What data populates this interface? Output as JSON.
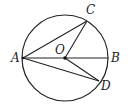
{
  "diagram": {
    "type": "circle-geometry",
    "circle": {
      "center": "O",
      "cx": 65,
      "cy": 58,
      "r": 43
    },
    "points": [
      {
        "id": "A",
        "x": 23,
        "y": 58,
        "label": "A",
        "lx": 11,
        "ly": 62
      },
      {
        "id": "B",
        "x": 108,
        "y": 58,
        "label": "B",
        "lx": 111,
        "ly": 62
      },
      {
        "id": "C",
        "x": 87,
        "y": 21,
        "label": "C",
        "lx": 86,
        "ly": 14
      },
      {
        "id": "D",
        "x": 99,
        "y": 81,
        "label": "D",
        "lx": 101,
        "ly": 90
      },
      {
        "id": "O",
        "x": 65,
        "y": 58,
        "label": "O",
        "lx": 55,
        "ly": 54
      }
    ],
    "segments": [
      [
        "A",
        "B"
      ],
      [
        "A",
        "C"
      ],
      [
        "A",
        "D"
      ],
      [
        "O",
        "C"
      ],
      [
        "O",
        "D"
      ]
    ],
    "labels": {
      "A": "A",
      "B": "B",
      "C": "C",
      "D": "D",
      "O": "O"
    },
    "colors": {
      "stroke": "#222222",
      "background": "#ffffff"
    }
  }
}
